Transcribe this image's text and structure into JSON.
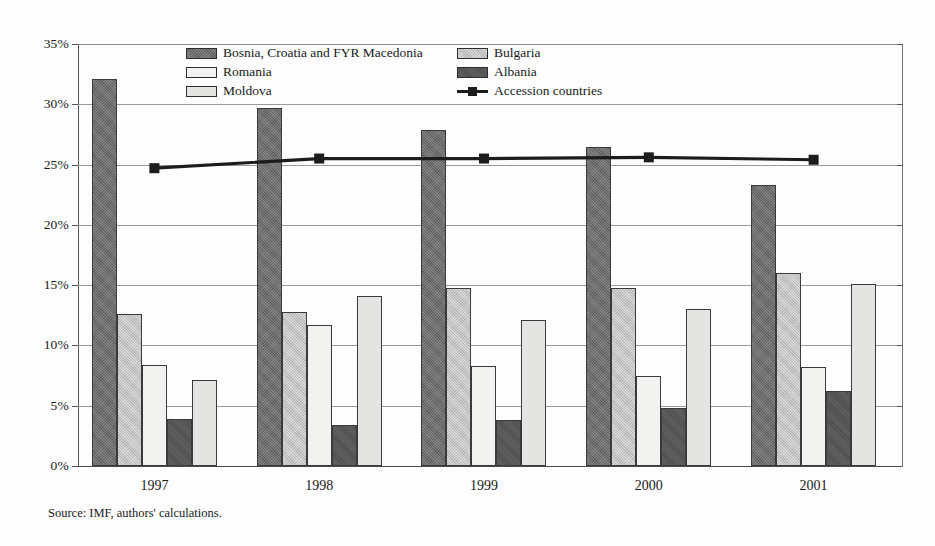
{
  "figure": {
    "source_note": "Source: IMF, authors' calculations."
  },
  "legend": {
    "left_column": [
      {
        "name": "Bosnia, Croatia and FYR Macedonia",
        "key": "bosnia-croatia-fyr-macedonia"
      },
      {
        "name": "Romania",
        "key": "romania"
      },
      {
        "name": "Moldova",
        "key": "moldova"
      }
    ],
    "right_column": [
      {
        "name": "Bulgaria",
        "key": "bulgaria"
      },
      {
        "name": "Albania",
        "key": "albania"
      },
      {
        "name": "Accession countries",
        "key": "accession-countries"
      }
    ]
  },
  "chart_data": {
    "type": "bar",
    "title": "",
    "xlabel": "",
    "ylabel": "",
    "categories": [
      "1997",
      "1998",
      "1999",
      "2000",
      "2001"
    ],
    "ylim": [
      0,
      35
    ],
    "ytick_labels": [
      "0%",
      "5%",
      "10%",
      "15%",
      "20%",
      "25%",
      "30%",
      "35%"
    ],
    "ytick_values": [
      0,
      5,
      10,
      15,
      20,
      25,
      30,
      35
    ],
    "grid": true,
    "legend_position": "top-center",
    "value_suffix": "%",
    "series": [
      {
        "name": "Bosnia, Croatia and FYR Macedonia",
        "type": "bar",
        "color": "#6e6e6e",
        "values": [
          32.1,
          29.7,
          27.9,
          26.5,
          23.3
        ]
      },
      {
        "name": "Bulgaria",
        "type": "bar",
        "color": "#c2c2c2",
        "values": [
          12.6,
          12.8,
          14.8,
          14.8,
          16.0
        ]
      },
      {
        "name": "Romania",
        "type": "bar",
        "color": "#f2f2f0",
        "values": [
          8.4,
          11.7,
          8.3,
          7.5,
          8.2
        ]
      },
      {
        "name": "Albania",
        "type": "bar",
        "color": "#4f4f4f",
        "values": [
          3.9,
          3.4,
          3.8,
          4.8,
          6.2
        ]
      },
      {
        "name": "Moldova",
        "type": "bar",
        "color": "#e4e4e2",
        "values": [
          7.1,
          14.1,
          12.1,
          13.0,
          15.1
        ]
      },
      {
        "name": "Accession countries",
        "type": "line",
        "color": "#1c1c1c",
        "marker": "square",
        "values": [
          24.7,
          25.5,
          25.5,
          25.6,
          25.4
        ]
      }
    ]
  }
}
